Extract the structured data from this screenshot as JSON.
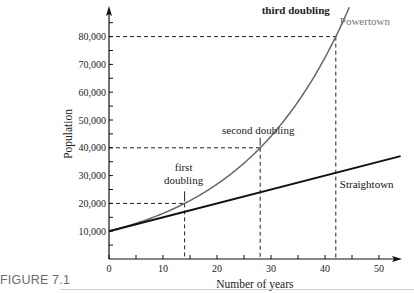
{
  "caption": "FIGURE 7.1",
  "chart_data": {
    "type": "line",
    "title": "",
    "xlabel": "Number of years",
    "ylabel": "Population",
    "xlim": [
      0,
      54
    ],
    "ylim": [
      0,
      92000
    ],
    "x_ticks": [
      0,
      10,
      20,
      30,
      40,
      50
    ],
    "x_minor_ticks": [
      5,
      15,
      25,
      35,
      45
    ],
    "y_ticks": [
      10000,
      20000,
      30000,
      40000,
      50000,
      60000,
      70000,
      80000
    ],
    "y_tick_labels": [
      "10,000",
      "20,000",
      "30,000",
      "40,000",
      "50,000",
      "60,000",
      "70,000",
      "80,000"
    ],
    "y_minor_ticks": [
      5000,
      15000,
      25000,
      35000,
      45000,
      55000,
      65000,
      75000,
      85000
    ],
    "x_tick_labels": [
      "0",
      "10",
      "20",
      "30",
      "40",
      "50"
    ],
    "grid": false,
    "legend": "none (inline labels)",
    "series": [
      {
        "name": "Powertown",
        "kind": "exponential",
        "formula": "10000 * 2^(t/14)",
        "color": "#666666",
        "x": [
          0,
          7,
          14,
          21,
          28,
          35,
          42,
          44.7
        ],
        "values": [
          10000,
          14142,
          20000,
          28284,
          40000,
          56569,
          80000,
          91500
        ]
      },
      {
        "name": "Straightown",
        "kind": "linear",
        "formula": "10000 + 500 * t",
        "color": "#111111",
        "x": [
          0,
          14,
          28,
          42,
          54
        ],
        "values": [
          10000,
          17000,
          24000,
          31000,
          37000
        ]
      }
    ],
    "annotations": [
      {
        "text_lines": [
          "first",
          "doubling"
        ],
        "x": 14,
        "y": 20000
      },
      {
        "text_lines": [
          "second doubling"
        ],
        "x": 28,
        "y": 40000
      },
      {
        "text_lines": [
          "third doubling"
        ],
        "x": 42,
        "y": 80000
      }
    ],
    "reference_lines": [
      {
        "type": "dashed",
        "x": 14,
        "y": 20000
      },
      {
        "type": "dashed",
        "x": 28,
        "y": 40000
      },
      {
        "type": "dashed",
        "x": 42,
        "y": 80000
      }
    ]
  }
}
